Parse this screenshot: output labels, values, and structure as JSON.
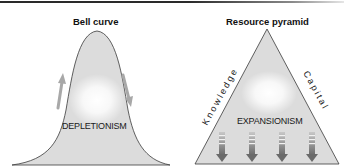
{
  "panels": {
    "bell": {
      "title": "Bell curve",
      "label": "DEPLETIONISM",
      "arrows": [
        "up-arrow",
        "down-arrow"
      ]
    },
    "pyramid": {
      "title": "Resource pyramid",
      "label": "EXPANSIONISM",
      "left_side_text": "Knowledge",
      "right_side_text": "Capital",
      "arrow_count": 4
    }
  },
  "colors": {
    "fill": "#dcdcdc",
    "outline": "#3a3a3a",
    "arrow": "#8c8c8c",
    "glow": "#ffffff"
  }
}
